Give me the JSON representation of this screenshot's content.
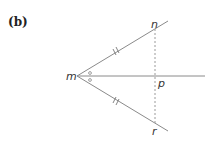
{
  "figure": {
    "label": "(b)",
    "points": {
      "m": "m",
      "n": "n",
      "p": "p",
      "r": "r"
    },
    "marks": {
      "equal_sides": "double tick marks on mn and mr",
      "equal_angles": "small o marks on angles nmp and pmr"
    },
    "colors": {
      "line": "#8a8a8a",
      "dashed": "#9a9a9a",
      "text": "#333333"
    }
  }
}
